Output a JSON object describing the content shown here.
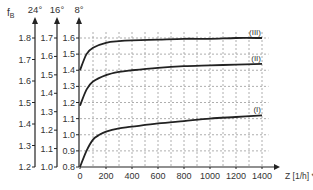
{
  "chart_data": {
    "type": "line",
    "title": "",
    "ylabel": "f_B",
    "xlabel": "Z [1/h] **",
    "xlim": [
      0,
      1400
    ],
    "x_ticks": [
      0,
      200,
      400,
      600,
      800,
      1000,
      1200,
      1400
    ],
    "grid": true,
    "y_axes": [
      {
        "label": "24°",
        "ticks": [
          1.2,
          1.3,
          1.4,
          1.5,
          1.6,
          1.7,
          1.8
        ]
      },
      {
        "label": "16°",
        "ticks": [
          1.0,
          1.1,
          1.2,
          1.3,
          1.4,
          1.5,
          1.6,
          1.7
        ]
      },
      {
        "label": "8°",
        "ticks": [
          0.8,
          0.9,
          1.0,
          1.1,
          1.2,
          1.3,
          1.4,
          1.5,
          1.6
        ]
      }
    ],
    "series_axis": "8°",
    "series": [
      {
        "name": "(III)",
        "x": [
          0,
          50,
          100,
          200,
          300,
          400,
          600,
          800,
          1000,
          1200,
          1400
        ],
        "values": [
          1.4,
          1.5,
          1.54,
          1.57,
          1.58,
          1.585,
          1.59,
          1.595,
          1.595,
          1.6,
          1.6
        ]
      },
      {
        "name": "(II)",
        "x": [
          0,
          50,
          100,
          200,
          300,
          400,
          600,
          800,
          1000,
          1200,
          1400
        ],
        "values": [
          1.18,
          1.28,
          1.33,
          1.37,
          1.39,
          1.4,
          1.415,
          1.425,
          1.43,
          1.435,
          1.44
        ]
      },
      {
        "name": "(I)",
        "x": [
          0,
          50,
          100,
          150,
          200,
          300,
          400,
          600,
          800,
          1000,
          1200,
          1400
        ],
        "values": [
          0.8,
          0.9,
          0.97,
          1.0,
          1.02,
          1.04,
          1.05,
          1.07,
          1.085,
          1.1,
          1.11,
          1.12
        ]
      }
    ]
  }
}
